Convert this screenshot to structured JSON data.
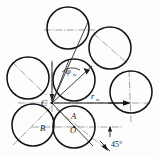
{
  "figure": {
    "type": "engineering-line-diagram",
    "canvas": {
      "width": 158,
      "height": 157
    },
    "colors": {
      "background": "#fdfdfd",
      "outline": "#141414",
      "centerline": "#6f6f6f",
      "dimension": "#1a1a1a"
    },
    "labels": [
      {
        "id": "C",
        "text": "C",
        "x": 41,
        "y": 106,
        "size": 9,
        "style": "italic",
        "role": "point-label",
        "note": "convergence point of construction rays"
      },
      {
        "id": "A",
        "text": "A",
        "x": 71,
        "y": 119,
        "size": 8.5,
        "style": "italic",
        "role": "point-label",
        "note": "upper point inside lower-middle circle"
      },
      {
        "id": "B",
        "text": "B",
        "x": 40,
        "y": 131,
        "size": 8.5,
        "style": "italic",
        "role": "point-label",
        "note": "label of lower-left circle"
      },
      {
        "id": "O",
        "text": "O",
        "x": 70,
        "y": 133,
        "size": 8.5,
        "style": "italic",
        "role": "point-label",
        "note": "centre of lower-middle circle"
      },
      {
        "id": "phi",
        "text": "φ",
        "x": 68,
        "y": 73,
        "size": 8.5,
        "style": "italic",
        "role": "angle-label",
        "note": "angle phi with subscript m"
      },
      {
        "id": "phi_sub",
        "text": "m",
        "x": 75,
        "y": 75,
        "size": 5,
        "style": "italic",
        "role": "angle-label-subscript"
      },
      {
        "id": "r",
        "text": "r",
        "x": 92,
        "y": 98,
        "size": 8.5,
        "style": "italic",
        "role": "dimension-label",
        "note": "radial dimension r"
      },
      {
        "id": "r_sub",
        "text": "m",
        "x": 97,
        "y": 100,
        "size": 5,
        "style": "italic",
        "role": "dimension-label-subscript"
      },
      {
        "id": "angle45",
        "text": "45°",
        "x": 112,
        "y": 146,
        "size": 8,
        "style": "normal",
        "role": "angle-dimension",
        "note": "45 degree angular dimension at lower right"
      }
    ],
    "circles": [
      {
        "id": "circle-top",
        "cx": 68,
        "cy": 28,
        "r": 21
      },
      {
        "id": "circle-top-right",
        "cx": 110,
        "cy": 48,
        "r": 21
      },
      {
        "id": "circle-left",
        "cx": 28,
        "cy": 78,
        "r": 21
      },
      {
        "id": "circle-middle",
        "cx": 74,
        "cy": 80,
        "r": 21
      },
      {
        "id": "circle-right",
        "cx": 131,
        "cy": 92,
        "r": 21
      },
      {
        "id": "circle-bottom-left",
        "cx": 33,
        "cy": 125,
        "r": 21
      },
      {
        "id": "circle-bottom-mid",
        "cx": 74,
        "cy": 127,
        "r": 21
      }
    ],
    "convergence_point": {
      "id": "C",
      "x": 52,
      "y": 103
    },
    "annotations": {
      "angle_symbol": "φ",
      "radius_symbol": "r",
      "subscript": "m",
      "degree_value": "45°"
    }
  }
}
